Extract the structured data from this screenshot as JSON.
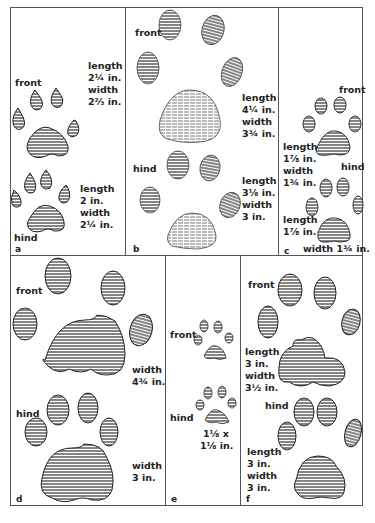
{
  "figure": {
    "panels": [
      {
        "id": "a",
        "letter": "a",
        "front": {
          "label": "front",
          "length": "length",
          "length_value": "2¼ in.",
          "width": "width",
          "width_value": "2⅔ in."
        },
        "hind": {
          "label": "hind",
          "length": "length",
          "length_value": "2 in.",
          "width": "width",
          "width_value": "2¼ in."
        }
      },
      {
        "id": "b",
        "letter": "b",
        "front": {
          "label": "front",
          "length": "length",
          "length_value": "4¼ in.",
          "width": "width",
          "width_value": "3¾ in."
        },
        "hind": {
          "label": "hind",
          "length": "length",
          "length_value": "3⅛ in.",
          "width": "width",
          "width_value": "3 in."
        }
      },
      {
        "id": "c",
        "letter": "c",
        "front": {
          "label": "front",
          "length": "length",
          "length_value": "1⅞ in.",
          "width": "width",
          "width_value": "1¾ in."
        },
        "hind": {
          "label": "hind",
          "length": "length",
          "length_value": "1⅞ in.",
          "width_line": "width 1¾ in."
        }
      },
      {
        "id": "d",
        "letter": "d",
        "front": {
          "label": "front",
          "width": "width",
          "width_value": "4¾ in."
        },
        "hind": {
          "label": "hind",
          "width": "width",
          "width_value": "3 in."
        }
      },
      {
        "id": "e",
        "letter": "e",
        "front": {
          "label": "front"
        },
        "hind": {
          "label": "hind",
          "size_line1": "1⅛ x",
          "size_line2": "1⅛ in."
        }
      },
      {
        "id": "f",
        "letter": "f",
        "front": {
          "label": "front",
          "length": "length",
          "length_value": "3 in.",
          "width": "width",
          "width_value": "3½ in."
        },
        "hind": {
          "label": "hind",
          "length": "length",
          "length_value": "3 in.",
          "width": "width",
          "width_value": "3 in."
        }
      }
    ],
    "colors": {
      "ink": "#222222",
      "border": "#555555",
      "fill": "#ffffff"
    }
  }
}
